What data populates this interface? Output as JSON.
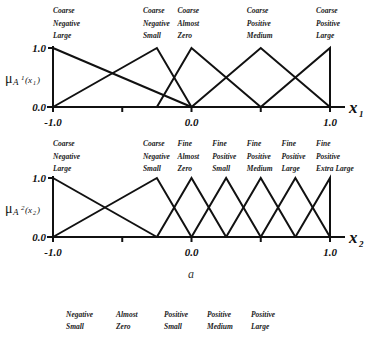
{
  "charts": [
    {
      "id": "x1",
      "y_label": "μA¹(x₁)",
      "y_label_main": "μ",
      "y_label_sub_A": "A",
      "y_label_sup": "1",
      "y_label_arg": "(x",
      "y_label_arg_sub": "1",
      "y_label_close": ")",
      "x_axis_name": "x",
      "x_axis_sub": "1",
      "y_ticks": [
        "1.0",
        "0.0"
      ],
      "x_ticks": [
        "-1.0",
        "0.0",
        "1.0"
      ],
      "sets": [
        {
          "label": [
            "Coarse",
            "Negative",
            "Large"
          ],
          "peak": -1.0,
          "left": -1.0,
          "right": 0.0
        },
        {
          "label": [
            "Coarse",
            "Negative",
            "Small"
          ],
          "peak": -0.25,
          "left": -1.0,
          "right": 0.0
        },
        {
          "label": [
            "Coarse",
            "Almost",
            "Zero"
          ],
          "peak": 0.0,
          "left": -0.25,
          "right": 0.5
        },
        {
          "label": [
            "Coarse",
            "Positive",
            "Medium"
          ],
          "peak": 0.5,
          "left": 0.0,
          "right": 1.0
        },
        {
          "label": [
            "Coarse",
            "Positive",
            "Large"
          ],
          "peak": 1.0,
          "left": 0.5,
          "right": 1.0
        }
      ]
    },
    {
      "id": "x2",
      "y_label": "μA²(x₂)",
      "y_label_main": "μ",
      "y_label_sub_A": "A",
      "y_label_sup": "2",
      "y_label_arg": "(x",
      "y_label_arg_sub": "2",
      "y_label_close": ")",
      "x_axis_name": "x",
      "x_axis_sub": "2",
      "y_ticks": [
        "1.0",
        "0.0"
      ],
      "x_ticks": [
        "-1.0",
        "0.0",
        "1.0"
      ],
      "sets": [
        {
          "label": [
            "Coarse",
            "Negative",
            "Large"
          ],
          "peak": -1.0,
          "left": -1.0,
          "right": -0.25
        },
        {
          "label": [
            "Coarse",
            "Negative",
            "Small"
          ],
          "peak": -0.25,
          "left": -1.0,
          "right": 0.0
        },
        {
          "label": [
            "Fine",
            "Almost",
            "Zero"
          ],
          "peak": 0.0,
          "left": -0.25,
          "right": 0.25
        },
        {
          "label": [
            "Fine",
            "Positive",
            "Small"
          ],
          "peak": 0.25,
          "left": 0.0,
          "right": 0.5
        },
        {
          "label": [
            "Fine",
            "Positive",
            "Medium"
          ],
          "peak": 0.5,
          "left": 0.25,
          "right": 0.75
        },
        {
          "label": [
            "Fine",
            "Positive",
            "Large"
          ],
          "peak": 0.75,
          "left": 0.5,
          "right": 1.0
        },
        {
          "label": [
            "Fine",
            "Positive",
            "Extra Large"
          ],
          "peak": 1.0,
          "left": 0.75,
          "right": 1.0
        }
      ]
    }
  ],
  "caption": "a",
  "bottom_labels": [
    [
      "Negative",
      "Small"
    ],
    [
      "Almost",
      "Zero"
    ],
    [
      "Positive",
      "Small"
    ],
    [
      "Positive",
      "Medium"
    ],
    [
      "Positive",
      "Large"
    ]
  ]
}
